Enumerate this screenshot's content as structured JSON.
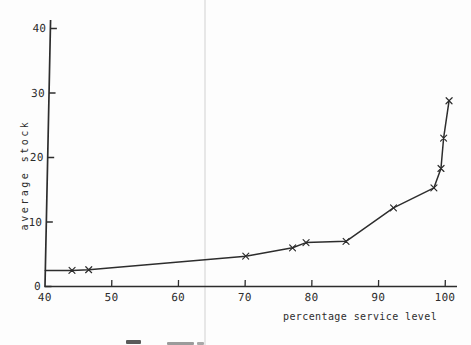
{
  "figure": {
    "background": "#fdfdfd",
    "ink": "#2d2d2d",
    "fold_line_color": "#e7e7e7"
  },
  "chart_data": {
    "type": "line",
    "xlabel": "percentage service level",
    "ylabel": "average stock",
    "x_ticks": [
      40,
      50,
      60,
      70,
      80,
      90,
      100
    ],
    "y_ticks": [
      0,
      10,
      20,
      30,
      40
    ],
    "xlim": [
      40,
      102
    ],
    "ylim": [
      0,
      41
    ],
    "grid": false,
    "legend": "none",
    "marker": "x",
    "points": [
      {
        "x": 40,
        "y": 2.5,
        "marker": false
      },
      {
        "x": 44,
        "y": 2.5,
        "marker": true
      },
      {
        "x": 46.5,
        "y": 2.6,
        "marker": true
      },
      {
        "x": 70,
        "y": 4.7,
        "marker": true
      },
      {
        "x": 77,
        "y": 6.0,
        "marker": true
      },
      {
        "x": 79,
        "y": 6.8,
        "marker": true
      },
      {
        "x": 85,
        "y": 7.0,
        "marker": true
      },
      {
        "x": 92,
        "y": 12.2,
        "marker": true
      },
      {
        "x": 98,
        "y": 15.3,
        "marker": true
      },
      {
        "x": 99,
        "y": 18.3,
        "marker": true
      },
      {
        "x": 99.3,
        "y": 23.0,
        "marker": true
      },
      {
        "x": 100,
        "y": 28.8,
        "marker": true
      }
    ]
  }
}
